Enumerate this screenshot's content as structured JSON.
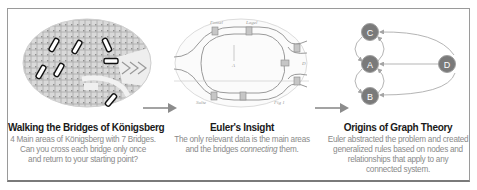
{
  "panels": [
    {
      "id": "konigsberg",
      "image": "konigsberg-map-with-7-highlighted-bridges",
      "title": "Walking the  Bridges of Königsberg",
      "description_lines": [
        "4 Main areas of Königsberg with 7 Bridges.",
        "Can you cross each bridge only once",
        "and return to your starting point?"
      ]
    },
    {
      "id": "euler",
      "image": "euler-hand-sketch-of-bridges",
      "title": "Euler's Insight",
      "description_lines": [
        "The only relevant data is the main areas",
        "and the bridges ",
        "connecting",
        " them."
      ]
    },
    {
      "id": "graph-theory",
      "image": "graph-of-nodes-and-edges",
      "title": "Origins of Graph Theory",
      "description_lines": [
        "Euler abstracted the problem and created",
        "generalized rules based on nodes and",
        "relationships that apply to any",
        "connected system."
      ],
      "graph": {
        "nodes": [
          "C",
          "A",
          "B",
          "D"
        ]
      }
    }
  ],
  "colors": {
    "node_fill": "#7a7a7a",
    "edge": "#b5b5b5",
    "arrow": "#8c8c8c",
    "title": "#1a1a1a",
    "description": "#8a8a8a"
  }
}
